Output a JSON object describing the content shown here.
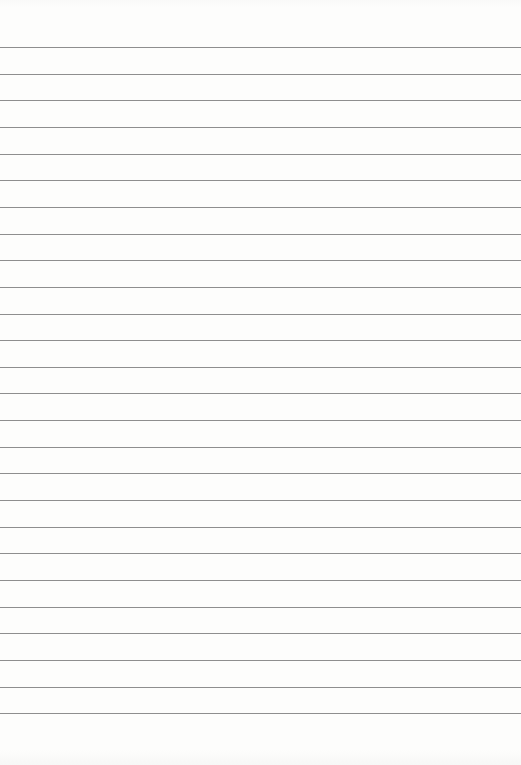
{
  "page": {
    "type": "lined-paper",
    "line_color": "#8e8e8e",
    "background_color": "#fcfcfb",
    "line_count": 26,
    "first_line_y": 47,
    "line_spacing": 26.65
  }
}
